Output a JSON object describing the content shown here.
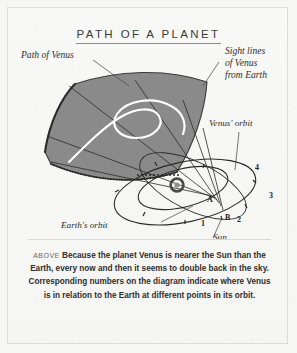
{
  "page": {
    "background_color": "#f6f6f4",
    "frame_color": "#dcdcd8"
  },
  "title": {
    "text": "PATH OF A PLANET"
  },
  "diagram": {
    "sky_patch": {
      "fill_color": "#8a8a8a",
      "edge_color": "#3a3a3a"
    },
    "retrograde_path_color": "#ffffff",
    "line_color": "#2b2b2b",
    "labels": {
      "path_of_venus": "Path of Venus",
      "sight_lines": "Sight lines",
      "sight_lines_2": "of Venus",
      "sight_lines_3": "from Earth",
      "venus_orbit": "Venus' orbit",
      "earths_orbit": "Earth's orbit",
      "sun": "Sun"
    },
    "earth_positions": [
      "1",
      "2",
      "3",
      "4"
    ],
    "venus_positions": [
      "A",
      "B"
    ]
  },
  "caption": {
    "above_label": "ABOVE",
    "line1": "Because the planet Venus is nearer the",
    "line2": "Sun than the Earth, every now and then it seems to",
    "line3": "double back in the sky. Corresponding numbers on",
    "line4": "the diagram indicate where Venus is in relation",
    "line5": "to the Earth at different points in its orbit."
  }
}
